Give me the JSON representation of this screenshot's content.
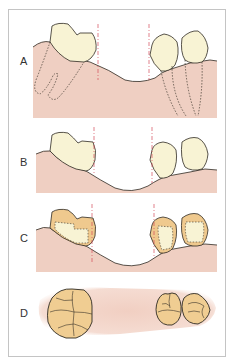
{
  "figure": {
    "panels": [
      {
        "id": "A",
        "label": "A",
        "description": "Extraction gap with roots shown dashed in alveolar bone"
      },
      {
        "id": "B",
        "label": "B",
        "description": "Tilted abutment teeth adjacent to edentulous ridge"
      },
      {
        "id": "C",
        "label": "C",
        "description": "Abutment teeth with preparation outlines (dashed) and crowns"
      },
      {
        "id": "D",
        "label": "D",
        "description": "Occlusal view of molar and premolars"
      }
    ],
    "colors": {
      "gum": "#efcfc2",
      "tooth": "#f8f3d4",
      "crown": "#efc98e",
      "occlusal": "#f0cd92",
      "outline": "#2e2a22",
      "guide_line": "#d44c5a",
      "frame": "#c4c4c4"
    }
  }
}
